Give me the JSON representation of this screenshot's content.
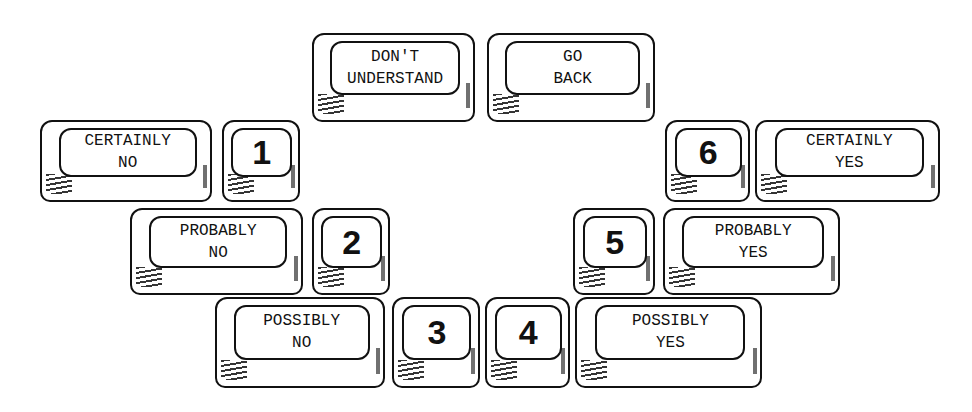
{
  "diagram": {
    "ink_color": "#111111",
    "background": "#ffffff",
    "keys": [
      {
        "id": "dont-understand",
        "label": "DON'T\nUNDERSTAND",
        "type": "word",
        "x": 312,
        "y": 33,
        "w": 163,
        "h": 89
      },
      {
        "id": "go-back",
        "label": "GO\nBACK",
        "type": "word",
        "x": 487,
        "y": 33,
        "w": 168,
        "h": 89
      },
      {
        "id": "certainly-no",
        "label": "CERTAINLY\nNO",
        "type": "word",
        "x": 40,
        "y": 120,
        "w": 172,
        "h": 82
      },
      {
        "id": "num-1",
        "label": "1",
        "type": "number",
        "x": 222,
        "y": 120,
        "w": 78,
        "h": 82
      },
      {
        "id": "num-6",
        "label": "6",
        "type": "number",
        "x": 665,
        "y": 120,
        "w": 85,
        "h": 82
      },
      {
        "id": "certainly-yes",
        "label": "CERTAINLY\nYES",
        "type": "word",
        "x": 755,
        "y": 120,
        "w": 185,
        "h": 82
      },
      {
        "id": "probably-no",
        "label": "PROBABLY\nNO",
        "type": "word",
        "x": 130,
        "y": 208,
        "w": 173,
        "h": 87
      },
      {
        "id": "num-2",
        "label": "2",
        "type": "number",
        "x": 312,
        "y": 208,
        "w": 78,
        "h": 87
      },
      {
        "id": "num-5",
        "label": "5",
        "type": "number",
        "x": 573,
        "y": 208,
        "w": 82,
        "h": 87
      },
      {
        "id": "probably-yes",
        "label": "PROBABLY\nYES",
        "type": "word",
        "x": 663,
        "y": 208,
        "w": 177,
        "h": 87
      },
      {
        "id": "possibly-no",
        "label": "POSSIBLY\nNO",
        "type": "word",
        "x": 215,
        "y": 297,
        "w": 170,
        "h": 91
      },
      {
        "id": "num-3",
        "label": "3",
        "type": "number",
        "x": 392,
        "y": 297,
        "w": 88,
        "h": 91
      },
      {
        "id": "num-4",
        "label": "4",
        "type": "number",
        "x": 485,
        "y": 297,
        "w": 85,
        "h": 91
      },
      {
        "id": "possibly-yes",
        "label": "POSSIBLY\nYES",
        "type": "word",
        "x": 575,
        "y": 297,
        "w": 187,
        "h": 91
      }
    ]
  }
}
